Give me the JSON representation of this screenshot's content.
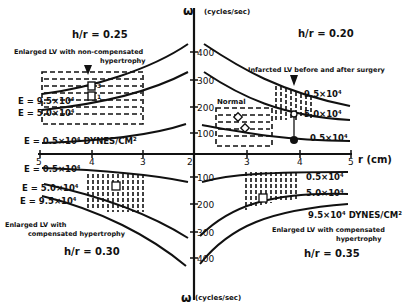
{
  "axes": {
    "omega_top_label": "ω",
    "omega_top_unit": "(cycles/sec)",
    "omega_bottom_label": "ω",
    "omega_bottom_unit": "(cycles/sec)",
    "r_label": "r (cm)",
    "omega_ticks": [
      "100",
      "200",
      "300",
      "400"
    ],
    "r_ticks_left": [
      "5",
      "4",
      "3"
    ],
    "r_tick_center": "2",
    "r_ticks_right": [
      "3",
      "4",
      "5"
    ]
  },
  "quadrants": {
    "top_left": {
      "ratio": "h/r = 0.25",
      "title_line1": "Enlarged LV with non-compensated",
      "title_line2": "hypertrophy",
      "e_labels": [
        "E = 9.5×10⁴",
        "E = 5.0×10⁴",
        "E = 0.5×10⁴ DYNES/CM²"
      ],
      "markers": [
        "3",
        "1"
      ]
    },
    "top_right": {
      "ratio": "h/r = 0.20",
      "title": "Infarcted LV before and after surgery",
      "normal_label": "Normal",
      "e_labels": [
        "9.5×10⁴",
        "5.0×10⁴",
        "0.5×10⁴"
      ]
    },
    "bottom_left": {
      "ratio": "h/r = 0.30",
      "title_line1": "Enlarged LV with",
      "title_line2": "compensated hypertrophy",
      "e_labels": [
        "E = 0.5×10⁴",
        "E = 5.0×10⁴",
        "E = 9.5×10⁴"
      ]
    },
    "bottom_right": {
      "ratio": "h/r = 0.35",
      "title_line1": "Enlarged LV with compensated",
      "title_line2": "hypertrophy",
      "e_labels": [
        "0.5×10⁴",
        "5.0×10⁴",
        "9.5×10⁴ DYNES/CM²"
      ]
    }
  }
}
